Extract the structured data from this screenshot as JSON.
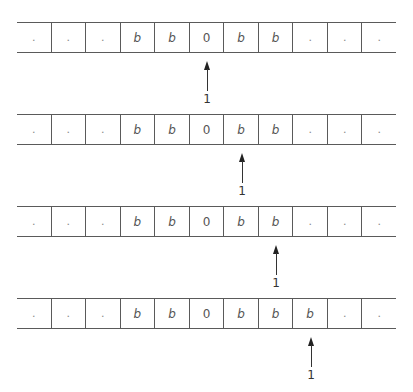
{
  "diagram": {
    "type": "turing-machine-tape-trace",
    "cell_count": 11,
    "steps": [
      {
        "cells": [
          ".",
          ".",
          ".",
          "b",
          "b",
          "0",
          "b",
          "b",
          ".",
          ".",
          "."
        ],
        "head_index": 5,
        "state": "1"
      },
      {
        "cells": [
          ".",
          ".",
          ".",
          "b",
          "b",
          "0",
          "b",
          "b",
          ".",
          ".",
          "."
        ],
        "head_index": 6,
        "state": "1"
      },
      {
        "cells": [
          ".",
          ".",
          ".",
          "b",
          "b",
          "0",
          "b",
          "b",
          ".",
          ".",
          "."
        ],
        "head_index": 7,
        "state": "1"
      },
      {
        "cells": [
          ".",
          ".",
          ".",
          "b",
          "b",
          "0",
          "b",
          "b",
          "b",
          ".",
          "."
        ],
        "head_index": 8,
        "state": "1"
      }
    ]
  },
  "colors": {
    "line": "#5a5a5a",
    "text": "#555555",
    "arrow": "#222222",
    "background": "#ffffff"
  }
}
